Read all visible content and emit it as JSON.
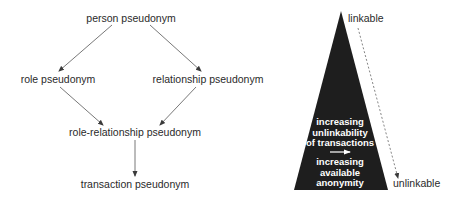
{
  "left_diagram": {
    "nodes": {
      "person": "person pseudonym",
      "role": "role pseudonym",
      "relationship": "relationship pseudonym",
      "role_relationship": "role-relationship pseudonym",
      "transaction": "transaction pseudonym"
    },
    "edges": [
      {
        "from": "person pseudonym",
        "to": "role pseudonym"
      },
      {
        "from": "person pseudonym",
        "to": "relationship pseudonym"
      },
      {
        "from": "role pseudonym",
        "to": "role-relationship pseudonym"
      },
      {
        "from": "relationship pseudonym",
        "to": "role-relationship pseudonym"
      },
      {
        "from": "role-relationship pseudonym",
        "to": "transaction pseudonym"
      }
    ]
  },
  "right_diagram": {
    "top_label": "linkable",
    "bottom_label": "unlinkable",
    "triangle_text_1": [
      "increasing",
      "unlinkability",
      "of transactions"
    ],
    "triangle_text_2": [
      "increasing",
      "available",
      "anonymity"
    ],
    "colors": {
      "triangle": "#1e1e1e",
      "text_on_triangle": "#ffffff",
      "dashed_line": "#777777"
    }
  }
}
